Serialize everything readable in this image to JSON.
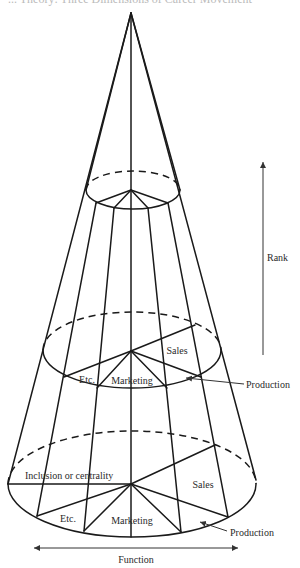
{
  "figure": {
    "caption_fragment": "... Theory: Three Dimensions of Career Movement",
    "type": "cone diagram",
    "colors": {
      "line": "#1a1a1a",
      "label": "#2a2a2a"
    }
  },
  "labels": {
    "rank": "Rank",
    "function": "Function",
    "inclusion": "Inclusion or centrality",
    "upper_sales": "Sales",
    "upper_marketing": "Marketing",
    "upper_etc": "Etc.",
    "upper_production": "Production",
    "lower_sales": "Sales",
    "lower_marketing": "Marketing",
    "lower_etc": "Etc.",
    "lower_production": "Production"
  },
  "axes": {
    "rank": {
      "label": "Rank",
      "direction": "up"
    },
    "function": {
      "label": "Function",
      "direction": "horizontal-both"
    }
  }
}
